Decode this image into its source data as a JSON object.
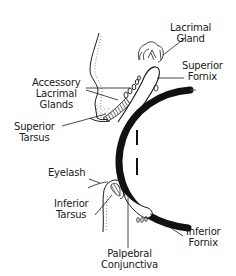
{
  "diagram": {
    "colors": {
      "ink": "#1a1a1a",
      "background": "#ffffff"
    },
    "labels": {
      "lacrimal_gland": {
        "line1": "Lacrimal",
        "line2": "Gland"
      },
      "superior_fornix": {
        "line1": "Superior",
        "line2": "Fornix"
      },
      "accessory_lacrimal_glands": {
        "line1": "Accessory",
        "line2": "Lacrimal",
        "line3": "Glands"
      },
      "superior_tarsus": {
        "line1": "Superior",
        "line2": "Tarsus"
      },
      "eyelash": {
        "line1": "Eyelash"
      },
      "inferior_tarsus": {
        "line1": "Inferior",
        "line2": "Tarsus"
      },
      "inferior_fornix": {
        "line1": "Inferior",
        "line2": "Fornix"
      },
      "palpebral_conjunctiva": {
        "line1": "Palpebral",
        "line2": "Conjunctiva"
      }
    }
  }
}
